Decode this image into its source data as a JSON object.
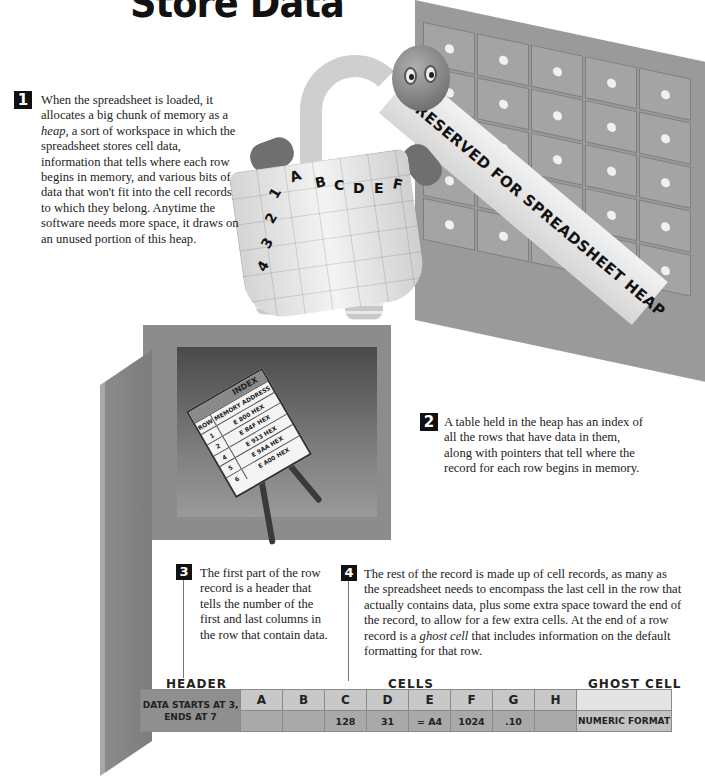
{
  "title": "Store Data",
  "steps": [
    {
      "number": "1",
      "text_parts": [
        "When the spreadsheet is loaded, it allocates a big chunk of memory as a ",
        "heap,",
        " a sort of workspace in which the spreadsheet stores cell data, information that tells where each row begins in memory, and various bits of data that won't fit into the cell records to which they belong. Anytime the software needs more space, it draws on an unused portion of this heap."
      ]
    },
    {
      "number": "2",
      "text": "A table held in the heap has an index of all the rows that have data in them, along with pointers that tell where the record for each row begins in memory."
    },
    {
      "number": "3",
      "text": "The first part of the row record is a header that tells the number of the first and last columns in the row that contain data."
    },
    {
      "number": "4",
      "text_parts": [
        "The rest of the record is made up of cell records, as many as the spreadsheet needs to encompass the last cell in the row that actually contains data, plus some extra space toward the end of the record, to allow for a few extra cells. At the end of a row record is a ",
        "ghost cell",
        " that includes information on the default formatting for that row."
      ]
    }
  ],
  "illustration": {
    "banner_text": "RESERVED FOR SPREADSHEET HEAP",
    "robot_columns": [
      "A",
      "B",
      "C",
      "D",
      "E",
      "F"
    ],
    "robot_rows": [
      "1",
      "2",
      "3",
      "4"
    ],
    "index_card": {
      "title": "INDEX",
      "col_row": "ROW",
      "col_addr": "MEMORY ADDRESS",
      "rows": [
        {
          "row": "1",
          "addr": "E 800 HEX"
        },
        {
          "row": "2",
          "addr": "E 84F HEX"
        },
        {
          "row": "4",
          "addr": "E 913 HEX"
        },
        {
          "row": "5",
          "addr": "E 9AA HEX"
        },
        {
          "row": "6",
          "addr": "E A00 HEX"
        }
      ]
    }
  },
  "record": {
    "labels": {
      "header": "HEADER",
      "cells": "CELLS",
      "ghost": "GHOST CELL"
    },
    "header_text": "DATA STARTS AT 3, ENDS AT 7",
    "columns": [
      "A",
      "B",
      "C",
      "D",
      "E",
      "F",
      "G",
      "H"
    ],
    "values": [
      "",
      "",
      "128",
      "31",
      "= A4",
      "1024",
      ".10",
      ""
    ],
    "ghost_text": "NUMERIC FORMAT"
  },
  "colors": {
    "header_cell": "#8f8f8f",
    "column_label": "#c8c8c8",
    "value_cell": "#a9a9a9",
    "ghost_top": "#e4e4e4",
    "ghost_bottom": "#c2c2c2"
  }
}
